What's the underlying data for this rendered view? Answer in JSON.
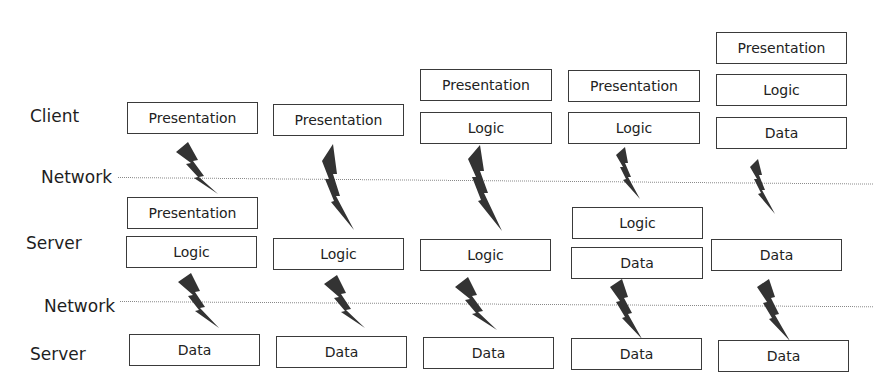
{
  "rows": {
    "client": "Client",
    "network1": "Network",
    "server1": "Server",
    "network2": "Network",
    "server2": "Server"
  },
  "columns": [
    {
      "boxes": [
        {
          "label": "Presentation",
          "tier": "client"
        },
        {
          "label": "Presentation",
          "tier": "server"
        },
        {
          "label": "Logic",
          "tier": "server"
        },
        {
          "label": "Data",
          "tier": "data-server"
        }
      ]
    },
    {
      "boxes": [
        {
          "label": "Presentation",
          "tier": "client"
        },
        {
          "label": "Logic",
          "tier": "server"
        },
        {
          "label": "Data",
          "tier": "data-server"
        }
      ]
    },
    {
      "boxes": [
        {
          "label": "Presentation",
          "tier": "client"
        },
        {
          "label": "Logic",
          "tier": "client"
        },
        {
          "label": "Logic",
          "tier": "server"
        },
        {
          "label": "Data",
          "tier": "data-server"
        }
      ]
    },
    {
      "boxes": [
        {
          "label": "Presentation",
          "tier": "client"
        },
        {
          "label": "Logic",
          "tier": "client"
        },
        {
          "label": "Logic",
          "tier": "server"
        },
        {
          "label": "Data",
          "tier": "server"
        },
        {
          "label": "Data",
          "tier": "data-server"
        }
      ]
    },
    {
      "boxes": [
        {
          "label": "Presentation",
          "tier": "client"
        },
        {
          "label": "Logic",
          "tier": "client"
        },
        {
          "label": "Data",
          "tier": "client"
        },
        {
          "label": "Data",
          "tier": "server"
        },
        {
          "label": "Data",
          "tier": "data-server"
        }
      ]
    }
  ]
}
